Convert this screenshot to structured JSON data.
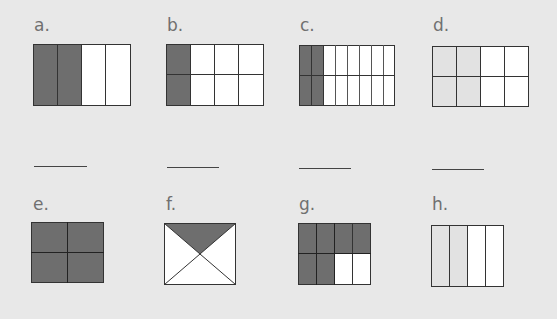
{
  "colors": {
    "background": "#e8e8e8",
    "shaded": "#6e6e6e",
    "light": "#e2e2e2",
    "empty": "#ffffff",
    "stroke": "#333333",
    "label": "#707070"
  },
  "figures": [
    {
      "id": "a",
      "label": "a.",
      "type": "grid",
      "cols": 4,
      "rows": 1,
      "shaded_cells": 2,
      "total_cells": 4,
      "shaded_fraction": "2/4",
      "shading": "dark, left 2 columns"
    },
    {
      "id": "b",
      "label": "b.",
      "type": "grid",
      "cols": 4,
      "rows": 2,
      "shaded_cells": 2,
      "total_cells": 8,
      "shaded_fraction": "2/8",
      "shading": "dark, left column"
    },
    {
      "id": "c",
      "label": "c.",
      "type": "grid",
      "cols": 8,
      "rows": 2,
      "shaded_cells": 4,
      "total_cells": 16,
      "shaded_fraction": "4/16",
      "shading": "dark, left 2 columns"
    },
    {
      "id": "d",
      "label": "d.",
      "type": "grid",
      "cols": 4,
      "rows": 2,
      "shaded_cells": 4,
      "total_cells": 8,
      "shaded_fraction": "4/8",
      "shading": "light gray, left 2 columns"
    },
    {
      "id": "e",
      "label": "e.",
      "type": "grid",
      "cols": 2,
      "rows": 2,
      "shaded_cells": 4,
      "total_cells": 4,
      "shaded_fraction": "4/4",
      "shading": "dark, all cells"
    },
    {
      "id": "f",
      "label": "f.",
      "type": "triangles",
      "parts": 4,
      "shaded_cells": 1,
      "total_cells": 4,
      "shaded_fraction": "1/4",
      "shading": "dark, top triangle"
    },
    {
      "id": "g",
      "label": "g.",
      "type": "grid",
      "cols": 4,
      "rows": 2,
      "shaded_cells": 6,
      "total_cells": 8,
      "shaded_fraction": "6/8",
      "shading": "dark, top row + 2 left bottom"
    },
    {
      "id": "h",
      "label": "h.",
      "type": "grid",
      "cols": 4,
      "rows": 1,
      "shaded_cells": 2,
      "total_cells": 4,
      "shaded_fraction": "2/4",
      "shading": "light gray, left 2 columns"
    }
  ],
  "answer_blanks": [
    "",
    "",
    "",
    ""
  ]
}
